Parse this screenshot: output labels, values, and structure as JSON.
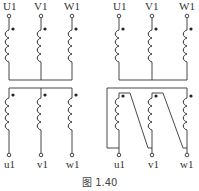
{
  "figure": {
    "caption": "图 1.40",
    "line_color": "#333333",
    "background": "#ffffff"
  },
  "left_diagram": {
    "description": "Three-phase transformer windings, primary and secondary both star connected",
    "primary_labels": [
      "U1",
      "V1",
      "W1"
    ],
    "secondary_labels": [
      "u1",
      "v1",
      "w1"
    ],
    "primary_connection": "star",
    "secondary_connection": "star"
  },
  "right_diagram": {
    "description": "Three-phase transformer windings, primary star, secondary delta connected",
    "primary_labels": [
      "U1",
      "V1",
      "W1"
    ],
    "secondary_labels": [
      "u1",
      "v1",
      "w1"
    ],
    "primary_connection": "star",
    "secondary_connection": "delta"
  }
}
